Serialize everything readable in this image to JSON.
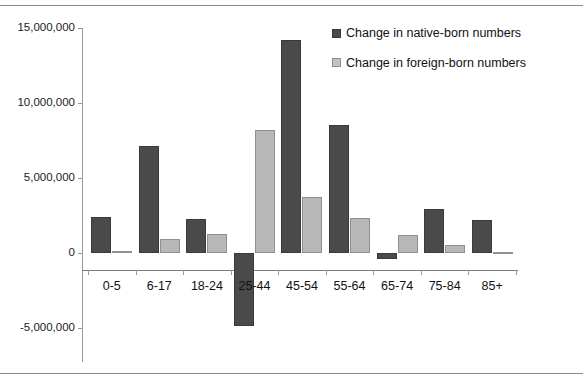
{
  "chart_data": {
    "type": "bar",
    "title": "",
    "xlabel": "",
    "ylabel": "",
    "ylim": [
      -5000000,
      15000000
    ],
    "grid": false,
    "legend_position": "top-right",
    "categories": [
      "0-5",
      "6-17",
      "18-24",
      "25-44",
      "45-54",
      "55-64",
      "65-74",
      "75-84",
      "85+"
    ],
    "ytick_labels": [
      "15,000,000",
      "10,000,000",
      "5,000,000",
      "0",
      "-5,000,000"
    ],
    "ytick_values": [
      15000000,
      10000000,
      5000000,
      0,
      -5000000
    ],
    "series": [
      {
        "name": "Change in native-born numbers",
        "color": "#4a4a4a",
        "values": [
          2400000,
          7100000,
          2250000,
          -4900000,
          14200000,
          8500000,
          -400000,
          2900000,
          2200000
        ]
      },
      {
        "name": "Change in foreign-born numbers",
        "color": "#b8b8b8",
        "values": [
          100000,
          900000,
          1250000,
          8200000,
          3750000,
          2300000,
          1200000,
          550000,
          50000
        ]
      }
    ]
  },
  "legend": {
    "items": [
      {
        "label": "Change in native-born numbers",
        "swatch": "native"
      },
      {
        "label": "Change in foreign-born numbers",
        "swatch": "foreign"
      }
    ]
  }
}
